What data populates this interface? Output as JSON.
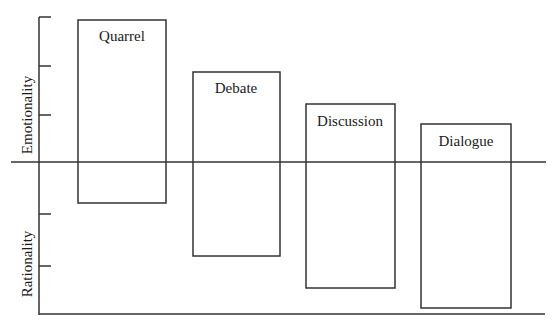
{
  "axes": {
    "y_upper_label": "Emotionality",
    "y_lower_label": "Rationality",
    "line_color": "#333333",
    "upper_ticks_y": [
      17,
      66,
      115
    ],
    "lower_ticks_y": [
      214,
      266
    ],
    "baseline_y": 162,
    "bottom_axis_y": 314,
    "axis_x": 39
  },
  "boxes": [
    {
      "label": "Quarrel",
      "x1": 78,
      "x2": 166,
      "top": 20,
      "bottom": 203
    },
    {
      "label": "Debate",
      "x1": 193,
      "x2": 280,
      "top": 72,
      "bottom": 256
    },
    {
      "label": "Discussion",
      "x1": 306,
      "x2": 395,
      "top": 104,
      "bottom": 288
    },
    {
      "label": "Dialogue",
      "x1": 421,
      "x2": 511,
      "top": 124,
      "bottom": 308
    }
  ]
}
